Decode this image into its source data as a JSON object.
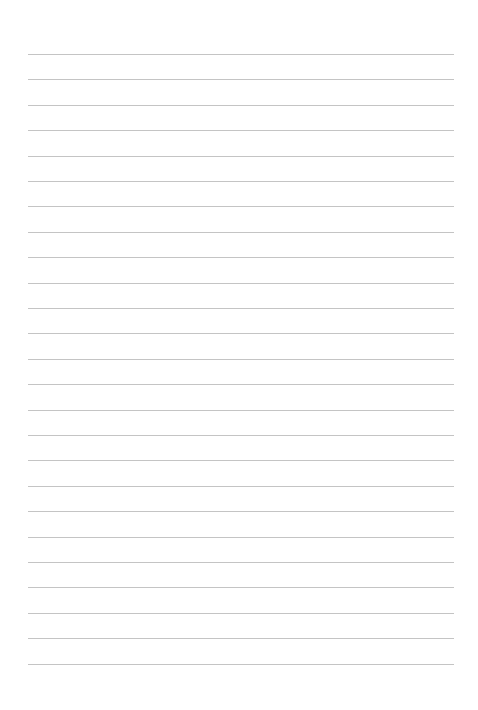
{
  "page": {
    "type": "lined-paper",
    "background": "#ffffff",
    "line_color": "#c4c4c4",
    "line_count": 25,
    "first_line_y": 54,
    "line_spacing": 25.4,
    "line_left": 28,
    "line_right": 454
  }
}
